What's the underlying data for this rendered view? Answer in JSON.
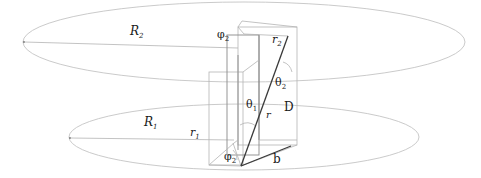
{
  "diagram": {
    "labels": {
      "R2": {
        "base": "R",
        "sub": "2"
      },
      "phi2_top": {
        "base": "φ",
        "sub": "2"
      },
      "r2": {
        "base": "r",
        "sub": "2"
      },
      "theta2": {
        "base": "θ",
        "sub": "2"
      },
      "theta1": {
        "base": "θ",
        "sub": "1"
      },
      "D": {
        "base": "D"
      },
      "r": {
        "base": "r"
      },
      "R1": {
        "base": "R",
        "sub": "1"
      },
      "r1": {
        "base": "r",
        "sub": "1"
      },
      "phi2_bottom": {
        "base": "φ",
        "sub": "2"
      },
      "b": {
        "base": "b"
      }
    }
  }
}
